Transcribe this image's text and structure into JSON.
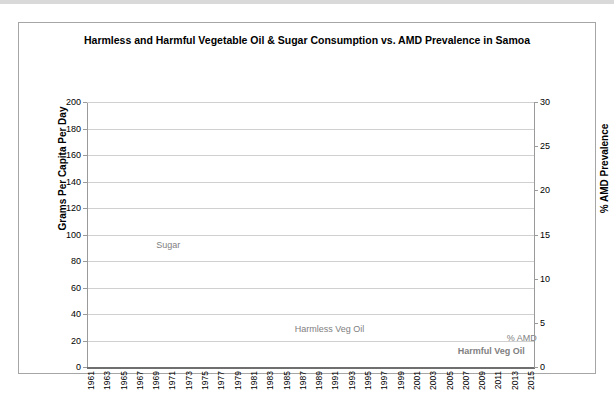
{
  "chart_data": {
    "type": "line",
    "title": "Harmless and Harmful Vegetable Oil & Sugar Consumption vs. AMD Prevalence in Samoa",
    "xlabel": "",
    "ylabel": "Grams Per Capita Per Day",
    "y2label": "% AMD Prevalence",
    "ylim": [
      0,
      200
    ],
    "y2lim": [
      0,
      30
    ],
    "yticks": [
      0,
      20,
      40,
      60,
      80,
      100,
      120,
      140,
      160,
      180,
      200
    ],
    "y2ticks": [
      0,
      5,
      10,
      15,
      20,
      25,
      30
    ],
    "grid": true,
    "legend_position": "inline-annotations",
    "x": [
      1961,
      1962,
      1963,
      1964,
      1965,
      1966,
      1967,
      1968,
      1969,
      1970,
      1971,
      1972,
      1973,
      1974,
      1975,
      1976,
      1977,
      1978,
      1979,
      1980,
      1981,
      1982,
      1983,
      1984,
      1985,
      1986,
      1987,
      1988,
      1989,
      1990,
      1991,
      1992,
      1993,
      1994,
      1995,
      1996,
      1997,
      1998,
      1999,
      2000,
      2001,
      2002,
      2003,
      2004,
      2005,
      2006,
      2007,
      2008,
      2009,
      2010,
      2011,
      2012,
      2013,
      2014,
      2015
    ],
    "xtick_labels": [
      "1961",
      "1963",
      "1965",
      "1967",
      "1969",
      "1971",
      "1973",
      "1975",
      "1977",
      "1979",
      "1981",
      "1983",
      "1985",
      "1987",
      "1989",
      "1991",
      "1993",
      "1995",
      "1997",
      "1999",
      "2001",
      "2003",
      "2005",
      "2007",
      "2009",
      "2011",
      "2013",
      "2015"
    ],
    "series": [
      {
        "name": "Sugar",
        "axis": "left",
        "style": "solid",
        "color": "#808080",
        "label_x": 1969,
        "label_y": 92,
        "values": [
          48,
          71,
          70,
          68,
          66,
          64,
          63,
          61,
          59,
          58,
          78,
          78,
          78,
          76,
          56,
          56,
          56,
          56,
          69,
          57,
          69,
          57,
          55,
          55,
          55,
          55,
          55,
          66,
          54,
          66,
          54,
          66,
          55,
          55,
          62,
          62,
          47,
          62,
          62,
          62,
          62,
          62,
          62,
          80,
          80,
          80,
          80,
          80,
          105,
          74,
          74,
          null,
          null,
          null,
          null
        ]
      },
      {
        "name": "Harmless Veg Oil",
        "axis": "left",
        "style": "dotted",
        "color": "#a6a6a6",
        "label_x": 1986,
        "label_y": 29,
        "values": [
          7,
          8,
          9,
          9,
          8,
          7,
          6,
          6,
          6,
          5,
          5,
          5,
          4,
          4,
          5,
          7,
          8,
          7,
          5,
          4,
          5,
          6,
          7,
          7,
          7,
          7,
          7,
          8,
          8,
          7,
          6,
          6,
          6,
          6,
          6,
          6,
          5,
          5,
          5,
          5,
          5,
          5,
          5,
          5,
          4,
          4,
          4,
          4,
          4,
          4,
          4,
          4,
          4,
          4,
          4
        ]
      },
      {
        "name": "Harmful Veg Oil",
        "axis": "left",
        "style": "dotted",
        "color": "#808080",
        "label_x": 2006,
        "label_y": 12,
        "values": [
          4,
          4,
          4,
          4,
          4,
          4,
          4,
          4,
          4,
          4,
          4,
          4,
          4,
          4,
          4,
          4,
          4,
          4,
          4,
          4,
          4,
          4,
          5,
          5,
          5,
          5,
          5,
          5,
          6,
          6,
          7,
          8,
          8,
          7,
          6,
          6,
          7,
          8,
          9,
          10,
          11,
          12,
          13,
          14,
          14,
          15,
          15,
          15,
          16,
          16,
          17,
          17,
          17,
          17,
          17
        ]
      },
      {
        "name": "% AMD",
        "axis": "right",
        "style": "marker-flat",
        "color": "#808080",
        "label_x": 2013,
        "label_y": 22,
        "values": [
          0,
          0,
          0,
          0,
          0,
          0,
          0,
          0,
          0,
          0,
          0,
          0,
          0,
          0,
          0,
          0,
          0,
          0,
          0,
          0,
          0,
          0,
          0,
          0,
          0,
          0,
          0,
          0,
          0,
          0,
          0,
          0,
          0,
          0,
          0,
          0,
          0,
          0,
          0,
          0,
          0,
          0,
          0,
          0,
          0,
          0,
          0,
          0,
          0,
          0,
          0,
          0,
          0,
          0,
          0.15
        ]
      }
    ],
    "annotations": [
      {
        "text": "Sugar",
        "name": "sugar-series-label"
      },
      {
        "text": "Harmless Veg Oil",
        "name": "harmless-veg-oil-series-label"
      },
      {
        "text": "Harmful Veg Oil",
        "name": "harmful-veg-oil-series-label"
      },
      {
        "text": "% AMD",
        "name": "amd-series-label"
      }
    ]
  },
  "colors": {
    "sugar": "#808080",
    "harmless_veg_oil": "#a6a6a6",
    "harmful_veg_oil": "#808080",
    "amd": "#808080",
    "grid": "#d0d0d0",
    "frame": "#a6a6a6",
    "axis": "#6f6f6f"
  }
}
